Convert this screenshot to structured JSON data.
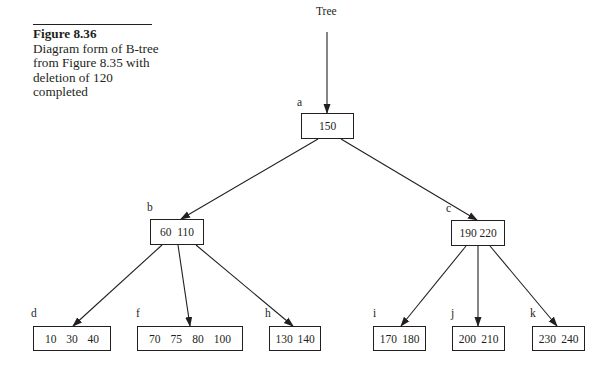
{
  "caption": {
    "title": "Figure 8.36",
    "text": "Diagram form of B-tree from Figure 8.35 with deletion of 120 completed"
  },
  "root_pointer": {
    "label": "Tree"
  },
  "nodes": {
    "a": {
      "label": "a",
      "keys": [
        "150"
      ]
    },
    "b": {
      "label": "b",
      "keys": [
        "60",
        "110"
      ]
    },
    "c": {
      "label": "c",
      "keys": [
        "190",
        "220"
      ]
    },
    "d": {
      "label": "d",
      "keys": [
        "10",
        "30",
        "40"
      ]
    },
    "f": {
      "label": "f",
      "keys": [
        "70",
        "75",
        "80",
        "100"
      ]
    },
    "h": {
      "label": "h",
      "keys": [
        "130",
        "140"
      ]
    },
    "i": {
      "label": "i",
      "keys": [
        "170",
        "180"
      ]
    },
    "j": {
      "label": "j",
      "keys": [
        "200",
        "210"
      ]
    },
    "k": {
      "label": "k",
      "keys": [
        "230",
        "240"
      ]
    }
  },
  "edges": [
    [
      "Tree",
      "a"
    ],
    [
      "a",
      "b"
    ],
    [
      "a",
      "c"
    ],
    [
      "b",
      "d"
    ],
    [
      "b",
      "f"
    ],
    [
      "b",
      "h"
    ],
    [
      "c",
      "i"
    ],
    [
      "c",
      "j"
    ],
    [
      "c",
      "k"
    ]
  ]
}
